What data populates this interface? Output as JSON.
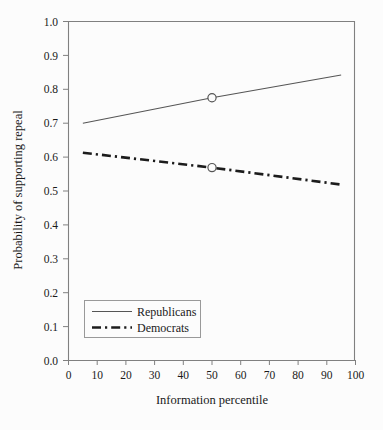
{
  "chart_data": {
    "type": "line",
    "title": "",
    "xlabel": "Information percentile",
    "ylabel": "Probability of supporting repeal",
    "xlim": [
      0,
      100
    ],
    "ylim": [
      0.0,
      1.0
    ],
    "grid": false,
    "legend_position": "lower-left-inside",
    "x_ticks": [
      "0",
      "10",
      "20",
      "30",
      "40",
      "50",
      "60",
      "70",
      "80",
      "90",
      "100"
    ],
    "x_tick_values": [
      0,
      10,
      20,
      30,
      40,
      50,
      60,
      70,
      80,
      90,
      100
    ],
    "y_ticks": [
      "0.0",
      "0.1",
      "0.2",
      "0.3",
      "0.4",
      "0.5",
      "0.6",
      "0.7",
      "0.8",
      "0.9",
      "1.0"
    ],
    "y_tick_values": [
      0.0,
      0.1,
      0.2,
      0.3,
      0.4,
      0.5,
      0.6,
      0.7,
      0.8,
      0.9,
      1.0
    ],
    "x": [
      5,
      50,
      95
    ],
    "series": [
      {
        "name": "Republicans",
        "values": [
          0.7,
          0.775,
          0.842
        ],
        "style": "solid",
        "color": "#555555",
        "marker_x": 50,
        "marker_y": 0.775
      },
      {
        "name": "Democrats",
        "values": [
          0.613,
          0.569,
          0.519
        ],
        "style": "dash-dot",
        "color": "#1c1c1c",
        "marker_x": 50,
        "marker_y": 0.569
      }
    ],
    "legend": [
      {
        "label": "Republicans",
        "style": "solid"
      },
      {
        "label": "Democrats",
        "style": "dash-dot"
      }
    ],
    "colors": {
      "background": "#fcfcfc",
      "axis": "#808080",
      "republicans": "#555555",
      "democrats": "#1c1c1c",
      "text": "#1a1a1a"
    }
  }
}
